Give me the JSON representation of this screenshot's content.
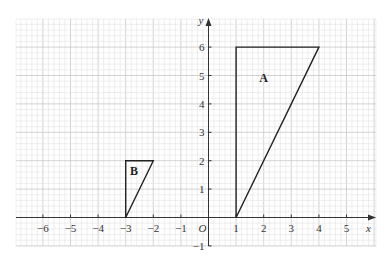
{
  "figure": {
    "x_axis_label": "x",
    "y_axis_label": "y",
    "origin_label": "O",
    "x_ticks": [
      -6,
      -5,
      -4,
      -3,
      -2,
      -1,
      1,
      2,
      3,
      4,
      5
    ],
    "y_ticks": [
      -1,
      1,
      2,
      3,
      4,
      5,
      6
    ],
    "x_range": [
      -7,
      6
    ],
    "y_range": [
      -1,
      7
    ],
    "grid": true,
    "minor_per_unit": 5,
    "colors": {
      "grid_minor": "#e3e3e3",
      "grid_major": "#c8c8c8",
      "axis": "#333333",
      "shape": "#222222"
    }
  },
  "shapes": [
    {
      "label": "A",
      "type": "triangle",
      "vertices": [
        [
          1,
          0
        ],
        [
          1,
          6
        ],
        [
          4,
          6
        ]
      ]
    },
    {
      "label": "B",
      "type": "triangle",
      "vertices": [
        [
          -3,
          0
        ],
        [
          -3,
          2
        ],
        [
          -2,
          2
        ]
      ]
    }
  ]
}
